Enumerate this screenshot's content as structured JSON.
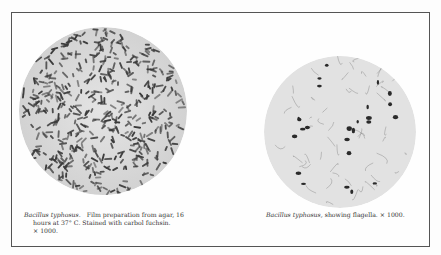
{
  "figures": [
    {
      "caption_species": "Bacillus typhosus.",
      "caption_line1": "Film preparation from agar, 16",
      "caption_line2": "hours at 37° C.   Stained with carbol fuchsin.",
      "caption_line3": "× 1000."
    },
    {
      "caption_species": "Bacillus typhosus,",
      "caption_line1": "showing flagella.   × 1000."
    }
  ]
}
